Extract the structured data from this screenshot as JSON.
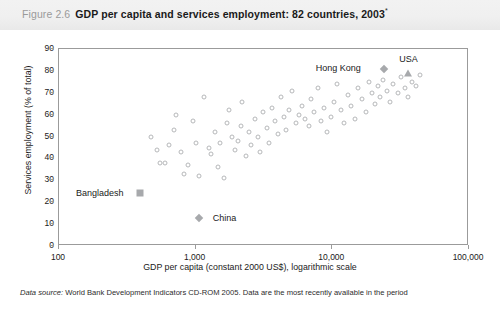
{
  "figure": {
    "number": "Figure 2.6",
    "title": "GDP per capita and services employment: 82 countries, 2003",
    "title_superscript": "*"
  },
  "source_note": {
    "label": "Data source:",
    "text": "World Bank Development Indicators CD-ROM 2005. Data are the most recently available in the period"
  },
  "chart_data": {
    "type": "scatter",
    "title": "GDP per capita and services employment: 82 countries, 2003",
    "xlabel": "GDP per capita (constant 2000 US$), logarithmic scale",
    "ylabel": "Services employment (% of total)",
    "xscale": "log",
    "xlim": [
      100,
      100000
    ],
    "ylim": [
      0,
      90
    ],
    "grid": false,
    "legend": "none",
    "xticks": [
      100,
      1000,
      10000,
      100000
    ],
    "xticklabels": [
      "100",
      "1,000",
      "10,000",
      "100,000"
    ],
    "yticks": [
      0,
      10,
      20,
      30,
      40,
      50,
      60,
      70,
      80,
      90
    ],
    "yticklabels": [
      "0",
      "10",
      "20",
      "30",
      "40",
      "50",
      "60",
      "70",
      "80",
      "90"
    ],
    "colors": {
      "marker_outline": "#b6b8ba",
      "marker_fill": "#a7a9ac",
      "axis": "#9b9b9b",
      "text": "#1a1a1a",
      "title_number": "#9a9a9a",
      "title_band": "#f0f0f0"
    },
    "annotations": [
      {
        "label": "Hong Kong",
        "x": 24000,
        "y": 81,
        "marker": "diamond",
        "label_dx": -46,
        "label_dy": -1
      },
      {
        "label": "USA",
        "x": 35500,
        "y": 79,
        "marker": "triangle",
        "label_dx": 1,
        "label_dy": -14
      },
      {
        "label": "Bangladesh",
        "x": 390,
        "y": 24,
        "marker": "square",
        "label_dx": -40,
        "label_dy": 0
      },
      {
        "label": "China",
        "x": 1050,
        "y": 13,
        "marker": "diamond",
        "label_dx": 26,
        "label_dy": 0
      }
    ],
    "points": [
      {
        "x": 470,
        "y": 50
      },
      {
        "x": 520,
        "y": 44
      },
      {
        "x": 545,
        "y": 38
      },
      {
        "x": 600,
        "y": 38
      },
      {
        "x": 640,
        "y": 46
      },
      {
        "x": 700,
        "y": 53
      },
      {
        "x": 720,
        "y": 60
      },
      {
        "x": 780,
        "y": 43
      },
      {
        "x": 820,
        "y": 33
      },
      {
        "x": 880,
        "y": 37
      },
      {
        "x": 950,
        "y": 57
      },
      {
        "x": 1000,
        "y": 47
      },
      {
        "x": 1060,
        "y": 32
      },
      {
        "x": 1150,
        "y": 68
      },
      {
        "x": 1250,
        "y": 45
      },
      {
        "x": 1300,
        "y": 42
      },
      {
        "x": 1380,
        "y": 52
      },
      {
        "x": 1450,
        "y": 36
      },
      {
        "x": 1500,
        "y": 47
      },
      {
        "x": 1600,
        "y": 31
      },
      {
        "x": 1700,
        "y": 56
      },
      {
        "x": 1750,
        "y": 62
      },
      {
        "x": 1850,
        "y": 50
      },
      {
        "x": 1950,
        "y": 44
      },
      {
        "x": 2050,
        "y": 48
      },
      {
        "x": 2150,
        "y": 55
      },
      {
        "x": 2200,
        "y": 66
      },
      {
        "x": 2350,
        "y": 41
      },
      {
        "x": 2450,
        "y": 52
      },
      {
        "x": 2550,
        "y": 46
      },
      {
        "x": 2700,
        "y": 58
      },
      {
        "x": 2850,
        "y": 50
      },
      {
        "x": 2950,
        "y": 43
      },
      {
        "x": 3100,
        "y": 61
      },
      {
        "x": 3300,
        "y": 54
      },
      {
        "x": 3450,
        "y": 47
      },
      {
        "x": 3600,
        "y": 63
      },
      {
        "x": 3800,
        "y": 57
      },
      {
        "x": 4000,
        "y": 51
      },
      {
        "x": 4200,
        "y": 68
      },
      {
        "x": 4400,
        "y": 59
      },
      {
        "x": 4600,
        "y": 53
      },
      {
        "x": 4800,
        "y": 62
      },
      {
        "x": 5100,
        "y": 71
      },
      {
        "x": 5400,
        "y": 56
      },
      {
        "x": 5700,
        "y": 60
      },
      {
        "x": 6000,
        "y": 64
      },
      {
        "x": 6300,
        "y": 58
      },
      {
        "x": 6700,
        "y": 55
      },
      {
        "x": 7000,
        "y": 67
      },
      {
        "x": 7400,
        "y": 61
      },
      {
        "x": 7800,
        "y": 72
      },
      {
        "x": 8200,
        "y": 57
      },
      {
        "x": 8700,
        "y": 63
      },
      {
        "x": 9200,
        "y": 52
      },
      {
        "x": 9700,
        "y": 59
      },
      {
        "x": 10200,
        "y": 66
      },
      {
        "x": 10800,
        "y": 74
      },
      {
        "x": 11500,
        "y": 62
      },
      {
        "x": 12200,
        "y": 56
      },
      {
        "x": 13000,
        "y": 69
      },
      {
        "x": 13800,
        "y": 64
      },
      {
        "x": 14600,
        "y": 58
      },
      {
        "x": 15500,
        "y": 72
      },
      {
        "x": 16500,
        "y": 67
      },
      {
        "x": 17500,
        "y": 61
      },
      {
        "x": 18500,
        "y": 75
      },
      {
        "x": 19500,
        "y": 70
      },
      {
        "x": 20500,
        "y": 65
      },
      {
        "x": 21500,
        "y": 73
      },
      {
        "x": 22500,
        "y": 68
      },
      {
        "x": 23500,
        "y": 76
      },
      {
        "x": 25000,
        "y": 71
      },
      {
        "x": 26500,
        "y": 66
      },
      {
        "x": 28000,
        "y": 74
      },
      {
        "x": 30000,
        "y": 70
      },
      {
        "x": 32000,
        "y": 77
      },
      {
        "x": 34000,
        "y": 72
      },
      {
        "x": 36000,
        "y": 68
      },
      {
        "x": 38000,
        "y": 75
      },
      {
        "x": 41000,
        "y": 73
      },
      {
        "x": 44000,
        "y": 78
      }
    ]
  }
}
